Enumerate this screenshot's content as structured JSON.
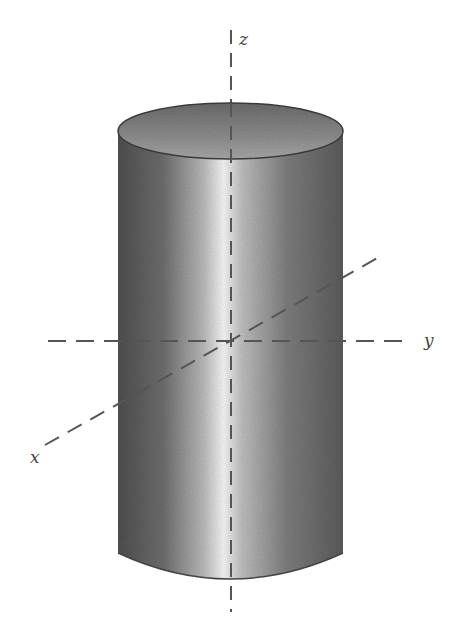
{
  "figure": {
    "axes": {
      "z_label": "z",
      "y_label": "y",
      "x_label": "x"
    },
    "colors": {
      "background": "#ffffff",
      "axis": "#555555",
      "cylinder_dark": "#5a5a5a",
      "cylinder_highlight": "#f2f2f2",
      "interior": "#9a9a9a",
      "rim": "#3a3a3a"
    }
  }
}
